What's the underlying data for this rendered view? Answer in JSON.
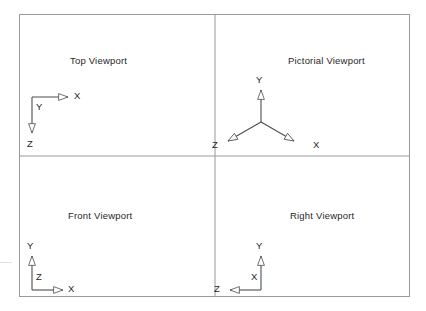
{
  "figure": {
    "frame": {
      "stroke_color": "#9a9a9a",
      "fill_color": "#ffffff",
      "x": 19,
      "y": 14,
      "width": 391,
      "height": 283,
      "divider_x": 215,
      "divider_y": 156
    },
    "axis_style": {
      "line_color": "#4d4d4d",
      "arrow_style": "open-triangle"
    }
  },
  "viewports": [
    {
      "id": "top",
      "label": "Top Viewport",
      "label_x": 70,
      "label_y": 63,
      "description": "Top view: X to the right, Z downward, Y toward viewer at origin",
      "axes": [
        {
          "name": "X",
          "direction": "right",
          "letter_x": 74,
          "letter_y": 102
        },
        {
          "name": "Y",
          "direction": "out-of-screen",
          "letter_x": 38,
          "letter_y": 113
        },
        {
          "name": "Z",
          "direction": "down",
          "letter_x": 28,
          "letter_y": 150
        }
      ]
    },
    {
      "id": "pictorial",
      "label": "Pictorial Viewport",
      "label_x": 288,
      "label_y": 63,
      "description": "Isometric tripod: Y up, X down-right, Z down-left",
      "axes": [
        {
          "name": "Y",
          "direction": "up",
          "letter_x": 256,
          "letter_y": 82
        },
        {
          "name": "X",
          "direction": "down-right",
          "letter_x": 313,
          "letter_y": 148
        },
        {
          "name": "Z",
          "direction": "down-left",
          "letter_x": 213,
          "letter_y": 148
        }
      ]
    },
    {
      "id": "front",
      "label": "Front Viewport",
      "label_x": 68,
      "label_y": 218,
      "description": "Front view: Y upward, X to the right, Z toward viewer at origin",
      "axes": [
        {
          "name": "Y",
          "direction": "up",
          "letter_x": 28,
          "letter_y": 248
        },
        {
          "name": "Z",
          "direction": "out-of-screen",
          "letter_x": 38,
          "letter_y": 283
        },
        {
          "name": "X",
          "direction": "right",
          "letter_x": 68,
          "letter_y": 295
        }
      ]
    },
    {
      "id": "right",
      "label": "Right Viewport",
      "label_x": 290,
      "label_y": 218,
      "description": "Right side view: Y upward, Z to the left, X toward viewer at origin",
      "axes": [
        {
          "name": "Y",
          "direction": "up",
          "letter_x": 256,
          "letter_y": 248
        },
        {
          "name": "X",
          "direction": "out-of-screen",
          "letter_x": 252,
          "letter_y": 283
        },
        {
          "name": "Z",
          "direction": "left",
          "letter_x": 215,
          "letter_y": 295
        }
      ]
    }
  ]
}
